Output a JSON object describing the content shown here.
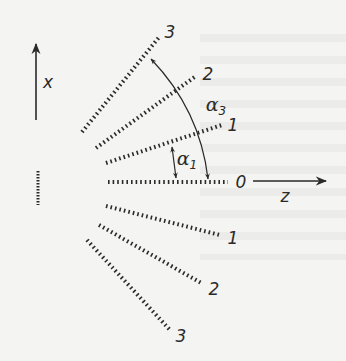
{
  "diagram": {
    "type": "diffraction-orders-fan",
    "colors": {
      "ink": "#2a2a2a",
      "paper": "#f4f4f2"
    },
    "axes": {
      "x": {
        "label": "x",
        "direction": "up"
      },
      "z": {
        "label": "z",
        "direction": "right"
      }
    },
    "source": {
      "name": "grating-aperture"
    },
    "orders": [
      {
        "id": "upper-3",
        "label": "3",
        "x1": 82,
        "y1": 132,
        "x2": 160,
        "y2": 36,
        "lx": 170,
        "ly": 32
      },
      {
        "id": "upper-2",
        "label": "2",
        "x1": 96,
        "y1": 148,
        "x2": 196,
        "y2": 76,
        "lx": 208,
        "ly": 74
      },
      {
        "id": "upper-1",
        "label": "1",
        "x1": 106,
        "y1": 163,
        "x2": 222,
        "y2": 125,
        "lx": 233,
        "ly": 125
      },
      {
        "id": "zero",
        "label": "0",
        "x1": 108,
        "y1": 182,
        "x2": 228,
        "y2": 182,
        "lx": 241,
        "ly": 182
      },
      {
        "id": "lower-1",
        "label": "1",
        "x1": 106,
        "y1": 206,
        "x2": 220,
        "y2": 235,
        "lx": 233,
        "ly": 238
      },
      {
        "id": "lower-2",
        "label": "2",
        "x1": 99,
        "y1": 225,
        "x2": 203,
        "y2": 284,
        "lx": 214,
        "ly": 289
      },
      {
        "id": "lower-3",
        "label": "3",
        "x1": 87,
        "y1": 240,
        "x2": 170,
        "y2": 330,
        "lx": 181,
        "ly": 336
      }
    ],
    "angles": [
      {
        "id": "alpha1",
        "symbol": "α",
        "subscript": "1"
      },
      {
        "id": "alpha3",
        "symbol": "α",
        "subscript": "3"
      }
    ]
  }
}
